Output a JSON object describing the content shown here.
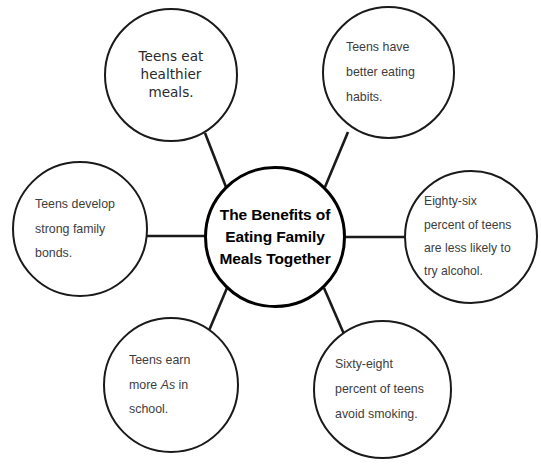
{
  "diagram": {
    "type": "hub-and-spoke-web",
    "center": {
      "id": "center",
      "label": "The Benefits of Eating Family Meals Together"
    },
    "nodes": [
      {
        "id": "top-left",
        "label": "Teens eat healthier meals.",
        "line1": "Teens eat",
        "line2": "healthier meals."
      },
      {
        "id": "top-right",
        "label": "Teens have better eating habits.",
        "line1": "Teens have",
        "line2": "better eating",
        "line3": "habits."
      },
      {
        "id": "left",
        "label": "Teens develop strong family bonds.",
        "line1": "Teens develop",
        "line2": "strong family",
        "line3": "bonds."
      },
      {
        "id": "right",
        "label": "Eighty-six percent of teens are less likely to try alcohol.",
        "line1": "Eighty-six",
        "line2": "percent of teens",
        "line3": "are less likely to",
        "line4": "try alcohol."
      },
      {
        "id": "bottom-left",
        "label": "Teens earn more As in school.",
        "line1": "Teens earn",
        "line2a": "more ",
        "line2b": "As",
        "line2c": " in",
        "line3": "school."
      },
      {
        "id": "bottom-right",
        "label": "Sixty-eight percent of teens avoid smoking.",
        "line1": "Sixty-eight",
        "line2": "percent of teens",
        "line3": "avoid smoking."
      }
    ],
    "colors": {
      "background": "#ffffff",
      "outline": "#1a1a1a",
      "center_outline": "#000000",
      "center_text": "#000000",
      "node_text": "#3d3d3d",
      "connector": "#1a1a1a"
    }
  }
}
